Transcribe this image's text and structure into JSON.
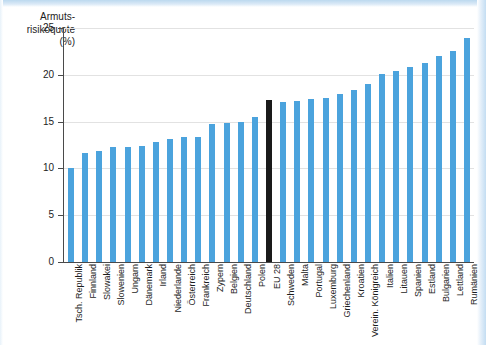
{
  "chart_data": {
    "type": "bar",
    "title": "Armuts-\nrisikoquote\n(%)",
    "xlabel": "",
    "ylabel": "",
    "ylim": [
      0,
      25
    ],
    "yticks": [
      0,
      5,
      10,
      15,
      20,
      25
    ],
    "grid": true,
    "legend": "none",
    "categories": [
      "Tsch. Republik",
      "Finnland",
      "Slowakei",
      "Slowenien",
      "Ungarn",
      "Dänemark",
      "Irland",
      "Niederlande",
      "Österreich",
      "Frankreich",
      "Zypern",
      "Belgien",
      "Deutschland",
      "Polen",
      "EU 28",
      "Schweden",
      "Malta",
      "Portugal",
      "Luxemburg",
      "Griechenland",
      "Kroatien",
      "Verein. Königreich",
      "Italien",
      "Litauen",
      "Spanien",
      "Estland",
      "Bulgarien",
      "Lettland",
      "Rumänien"
    ],
    "values": [
      10.0,
      11.6,
      11.9,
      12.3,
      12.3,
      12.4,
      12.8,
      13.1,
      13.4,
      13.4,
      14.7,
      14.9,
      15.0,
      15.5,
      17.3,
      17.1,
      17.2,
      17.4,
      17.5,
      18.0,
      18.4,
      19.0,
      20.1,
      20.4,
      20.8,
      21.3,
      22.0,
      22.5,
      23.9
    ],
    "highlight_category": "EU 28",
    "series_color": "#4ba3dd",
    "highlight_color": "#1a1a1a"
  }
}
